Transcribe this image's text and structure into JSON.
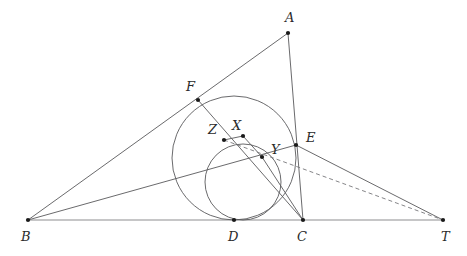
{
  "figure": {
    "width": 467,
    "height": 256,
    "background_color": "#ffffff",
    "stroke_color": "#59595b",
    "baseline_color": "#8d8d90",
    "dash_color": "#77777a",
    "dot_color": "#1a1a1a"
  },
  "points": [
    {
      "id": "A",
      "label": "A",
      "x": 288,
      "y": 33,
      "label_x": 285,
      "label_y": 11
    },
    {
      "id": "B",
      "label": "B",
      "x": 28,
      "y": 220,
      "label_x": 21,
      "label_y": 230
    },
    {
      "id": "C",
      "label": "C",
      "x": 303,
      "y": 220,
      "label_x": 297,
      "label_y": 230
    },
    {
      "id": "D",
      "label": "D",
      "x": 234,
      "y": 220,
      "label_x": 228,
      "label_y": 230
    },
    {
      "id": "E",
      "label": "E",
      "x": 296,
      "y": 145,
      "label_x": 306,
      "label_y": 131
    },
    {
      "id": "F",
      "label": "F",
      "x": 198,
      "y": 100,
      "label_x": 186,
      "label_y": 80
    },
    {
      "id": "T",
      "label": "T",
      "x": 443,
      "y": 220,
      "label_x": 441,
      "label_y": 230
    },
    {
      "id": "X",
      "label": "X",
      "x": 243,
      "y": 136,
      "label_x": 232,
      "label_y": 119
    },
    {
      "id": "Y",
      "label": "Y",
      "x": 262,
      "y": 157,
      "label_x": 271,
      "label_y": 143
    },
    {
      "id": "Z",
      "label": "Z",
      "x": 224,
      "y": 140,
      "label_x": 208,
      "label_y": 123
    }
  ],
  "circles": [
    {
      "id": "incircle",
      "name": "large-circle",
      "cx": 234,
      "cy": 158,
      "r": 62,
      "style": "solid"
    },
    {
      "id": "small-circle",
      "name": "small-circle",
      "cx": 243,
      "cy": 182,
      "r": 38,
      "style": "solid"
    }
  ],
  "segments": [
    {
      "id": "BT",
      "name": "baseline-b-to-t",
      "from": "B",
      "to": "T",
      "style": "baseline"
    },
    {
      "id": "BA",
      "name": "segment-b-to-a",
      "from": "B",
      "to": "A",
      "style": "solid"
    },
    {
      "id": "AC",
      "name": "segment-a-to-c",
      "from": "A",
      "to": "C",
      "style": "solid"
    },
    {
      "id": "BE",
      "name": "segment-b-to-e",
      "from": "B",
      "to": "E",
      "style": "solid"
    },
    {
      "id": "ET",
      "name": "segment-e-to-t",
      "from": "E",
      "to": "T",
      "style": "solid"
    },
    {
      "id": "FY",
      "name": "segment-f-to-c-via-y",
      "from": "F",
      "to": "C",
      "style": "solid"
    },
    {
      "id": "XZ",
      "name": "segment-x-to-z",
      "from": "X",
      "to": "Z",
      "style": "solid"
    },
    {
      "id": "XY",
      "name": "segment-x-to-y",
      "from": "X",
      "to": "Y",
      "style": "solid"
    },
    {
      "id": "YC",
      "name": "segment-y-to-c",
      "from": "Y",
      "to": "C",
      "style": "solid"
    }
  ],
  "dashed_segments": [
    {
      "id": "ZT",
      "name": "dashed-z-to-t",
      "from": "Z",
      "to": "T",
      "style": "dashed"
    }
  ]
}
